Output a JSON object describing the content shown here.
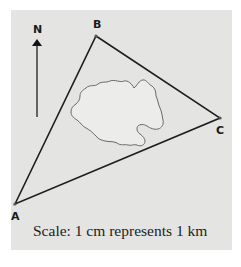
{
  "diagram": {
    "type": "map-triangle",
    "colors": {
      "panel_bg": "#e4e4e2",
      "edge": "#1e1e1e",
      "region_fill": "#ececea",
      "region_outline": "#6a6a6a"
    },
    "vertices": [
      {
        "id": "A",
        "label": "A",
        "x": 15,
        "y": 204
      },
      {
        "id": "B",
        "label": "B",
        "x": 96,
        "y": 36
      },
      {
        "id": "C",
        "label": "C",
        "x": 220,
        "y": 118
      }
    ],
    "edges": [
      [
        "A",
        "B"
      ],
      [
        "B",
        "C"
      ],
      [
        "C",
        "A"
      ]
    ],
    "north_arrow": {
      "label": "N"
    },
    "scale_text": "Scale: 1 cm represents 1 km"
  }
}
